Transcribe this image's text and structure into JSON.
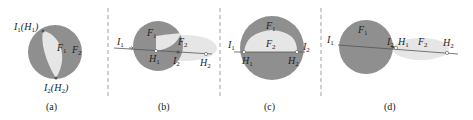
{
  "colors": {
    "dark_region": "#8f8f8f",
    "light_region": "#e6e6e6",
    "line": "#555555",
    "divider": "#888888"
  },
  "panels": [
    {
      "caption": "(a)",
      "labels": {
        "top_point": "I",
        "top_point_sub": "1",
        "top_point_alt": "(H",
        "top_point_alt_sub": "1",
        "top_close": ")",
        "bottom_point": "I",
        "bottom_point_sub": "2",
        "bottom_point_alt": "(H",
        "bottom_point_alt_sub": "2",
        "bottom_close": ")",
        "light_region": "F",
        "light_region_sub": "1",
        "dark_region": "F",
        "dark_region_sub": "2"
      }
    },
    {
      "caption": "(b)",
      "labels": {
        "circle_region": "F",
        "circle_region_sub": "1",
        "ellipse_region": "F",
        "ellipse_region_sub": "2",
        "i1": "I",
        "i1_sub": "1",
        "h1": "H",
        "h1_sub": "1",
        "i2": "I",
        "i2_sub": "2",
        "h2": "H",
        "h2_sub": "2"
      }
    },
    {
      "caption": "(c)",
      "labels": {
        "circle_region": "F",
        "circle_region_sub": "1",
        "inner_region": "F",
        "inner_region_sub": "2",
        "i1": "I",
        "i1_sub": "1",
        "i2": "I",
        "i2_sub": "2",
        "h1": "H",
        "h1_sub": "1",
        "h2": "H",
        "h2_sub": "2"
      }
    },
    {
      "caption": "(d)",
      "labels": {
        "circle_region": "F",
        "circle_region_sub": "1",
        "ellipse_region": "F",
        "ellipse_region_sub": "2",
        "i1": "I",
        "i1_sub": "1",
        "i2": "I",
        "i2_sub": "2",
        "h1": "H",
        "h1_sub": "1",
        "h2": "H",
        "h2_sub": "2"
      }
    }
  ]
}
